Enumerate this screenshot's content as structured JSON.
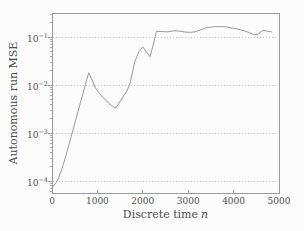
{
  "chart_data": {
    "type": "line",
    "title": "",
    "xlabel_text": "Discrete time",
    "xlabel_variable": "n",
    "ylabel": "Autonomous run MSE",
    "x_ticks": [
      0,
      1000,
      2000,
      3000,
      4000,
      5000
    ],
    "y_tick_exponents": [
      -1,
      -2,
      -3,
      -4
    ],
    "xlim": [
      0,
      5000
    ],
    "ylim": [
      5.6e-05,
      0.316
    ],
    "y_scale": "log",
    "grid": "horizontal dotted lines at each decade",
    "legend": "none",
    "series": [
      {
        "name": "Autonomous run MSE",
        "x": [
          0,
          40,
          100,
          150,
          220,
          300,
          380,
          450,
          530,
          610,
          680,
          750,
          810,
          870,
          950,
          1050,
          1150,
          1250,
          1320,
          1400,
          1480,
          1560,
          1650,
          1720,
          1830,
          1920,
          2000,
          2080,
          2160,
          2240,
          2300,
          2400,
          2550,
          2700,
          2820,
          2930,
          3050,
          3150,
          3280,
          3400,
          3550,
          3700,
          3850,
          4000,
          4150,
          4300,
          4420,
          4520,
          4650,
          4750,
          4840
        ],
        "y": [
          7.2e-05,
          8e-05,
          9.5e-05,
          0.00012,
          0.00018,
          0.00032,
          0.0006,
          0.00105,
          0.002,
          0.0038,
          0.0065,
          0.0115,
          0.018,
          0.0135,
          0.009,
          0.0066,
          0.0052,
          0.0042,
          0.0037,
          0.0033,
          0.0042,
          0.0056,
          0.0075,
          0.011,
          0.032,
          0.05,
          0.062,
          0.049,
          0.039,
          0.075,
          0.132,
          0.13,
          0.128,
          0.135,
          0.132,
          0.127,
          0.125,
          0.128,
          0.142,
          0.156,
          0.163,
          0.165,
          0.162,
          0.152,
          0.142,
          0.128,
          0.115,
          0.112,
          0.138,
          0.132,
          0.128
        ]
      }
    ]
  },
  "colors": {
    "background": "#fcfcfc",
    "frame": "#9a9a9a",
    "grid": "#cccccc",
    "series_line": "#8f8f8f",
    "text": "#4f4f4f"
  }
}
